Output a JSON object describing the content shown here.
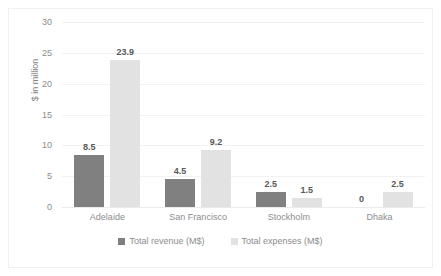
{
  "chart_data": {
    "type": "bar",
    "title": "",
    "subtitle": "",
    "xlabel": "",
    "ylabel": "$ in million",
    "categories": [
      "Adelaide",
      "San Francisco",
      "Stockholm",
      "Dhaka"
    ],
    "series": [
      {
        "name": "Total revenue (M$)",
        "color": "#808080",
        "values": [
          8.5,
          4.5,
          2.5,
          0
        ],
        "labels": [
          "8.5",
          "4.5",
          "2.5",
          "0"
        ]
      },
      {
        "name": "Total expenses (M$)",
        "color": "#e2e2e2",
        "values": [
          23.9,
          9.2,
          1.5,
          2.5
        ],
        "labels": [
          "23.9",
          "9.2",
          "1.5",
          "2.5"
        ]
      }
    ],
    "ylim": [
      0,
      30
    ],
    "yticks": [
      0,
      5,
      10,
      15,
      20,
      25,
      30
    ],
    "ytick_labels": [
      "0",
      "5",
      "10",
      "15",
      "20",
      "25",
      "30"
    ],
    "grid": "horizontal",
    "legend_position": "bottom"
  },
  "colors": {
    "revenue": "#808080",
    "expenses": "#e2e2e2",
    "gridline": "#f2f2f2",
    "axis_text": "#8c8c8c",
    "label_text": "#595959",
    "border": "#f0f0f0",
    "background": "#ffffff"
  }
}
